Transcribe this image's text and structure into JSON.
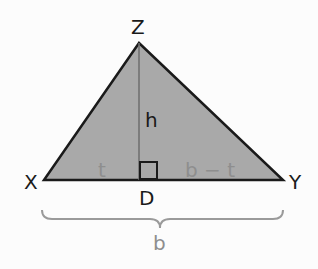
{
  "diagram": {
    "type": "triangle-with-altitude",
    "vertices": {
      "Z": "Z",
      "X": "X",
      "Y": "Y",
      "D": "D"
    },
    "labels": {
      "height": "h",
      "left_segment": "t",
      "right_segment": "b − t",
      "base": "b"
    },
    "colors": {
      "fill": "#a8a8a8",
      "stroke": "#1a1a1a",
      "altitude": "#6e6e6e",
      "segment_label": "#8e8e8e"
    }
  }
}
